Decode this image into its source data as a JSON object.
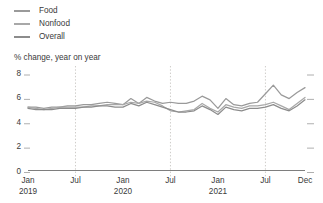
{
  "legend": {
    "position": "top-left",
    "items": [
      {
        "label": "Food",
        "color": "#9a9a9a",
        "icon": "line-swatch-icon"
      },
      {
        "label": "Nonfood",
        "color": "#a8a8a8",
        "icon": "line-swatch-icon"
      },
      {
        "label": "Overall",
        "color": "#8c8c8c",
        "icon": "line-swatch-icon"
      }
    ]
  },
  "axis": {
    "y_title": "% change, year on year",
    "y_ticks": [
      "8",
      "6",
      "4",
      "2",
      "0"
    ],
    "x_ticks": [
      {
        "label": "Jan",
        "sub": "2019"
      },
      {
        "label": "Jul",
        "sub": ""
      },
      {
        "label": "Jan",
        "sub": "2020"
      },
      {
        "label": "Jul",
        "sub": ""
      },
      {
        "label": "Jan",
        "sub": "2021"
      },
      {
        "label": "Jul",
        "sub": ""
      },
      {
        "label": "Dec",
        "sub": ""
      }
    ]
  },
  "chart_data": {
    "type": "line",
    "title": "",
    "subtitle": "",
    "xlabel": "",
    "ylabel": "% change, year on year",
    "ylim": [
      0,
      8
    ],
    "xlim": [
      "2019-01",
      "2021-12"
    ],
    "grid": "vertical-dashed-at-july",
    "legend_position": "top-left",
    "gridlines_x": [
      "2019-07",
      "2020-07",
      "2021-07"
    ],
    "x": [
      "2019-01",
      "2019-02",
      "2019-03",
      "2019-04",
      "2019-05",
      "2019-06",
      "2019-07",
      "2019-08",
      "2019-09",
      "2019-10",
      "2019-11",
      "2019-12",
      "2020-01",
      "2020-02",
      "2020-03",
      "2020-04",
      "2020-05",
      "2020-06",
      "2020-07",
      "2020-08",
      "2020-09",
      "2020-10",
      "2020-11",
      "2020-12",
      "2021-01",
      "2021-02",
      "2021-03",
      "2021-04",
      "2021-05",
      "2021-06",
      "2021-07",
      "2021-08",
      "2021-09",
      "2021-10",
      "2021-11",
      "2021-12"
    ],
    "series": [
      {
        "name": "Food",
        "color": "#9a9a9a",
        "values": [
          5.2,
          5.2,
          5.1,
          5.2,
          5.2,
          5.3,
          5.3,
          5.4,
          5.4,
          5.5,
          5.6,
          5.5,
          5.4,
          5.9,
          5.5,
          6.0,
          5.7,
          5.5,
          5.6,
          5.5,
          5.5,
          5.7,
          6.1,
          5.8,
          5.1,
          5.9,
          5.4,
          5.3,
          5.5,
          5.6,
          6.3,
          7.0,
          6.2,
          5.9,
          6.4,
          6.8
        ]
      },
      {
        "name": "Nonfood",
        "color": "#a8a8a8",
        "values": [
          5.2,
          5.1,
          5.0,
          5.1,
          5.2,
          5.2,
          5.2,
          5.2,
          5.3,
          5.3,
          5.4,
          5.4,
          5.4,
          5.6,
          5.5,
          5.7,
          5.6,
          5.3,
          4.9,
          4.8,
          4.9,
          5.0,
          5.5,
          5.1,
          4.8,
          5.4,
          5.2,
          5.1,
          5.3,
          5.3,
          5.4,
          5.6,
          5.3,
          5.0,
          5.5,
          6.0
        ]
      },
      {
        "name": "Overall",
        "color": "#8c8c8c",
        "values": [
          5.1,
          5.0,
          5.0,
          5.0,
          5.1,
          5.1,
          5.1,
          5.2,
          5.2,
          5.3,
          5.3,
          5.2,
          5.2,
          5.5,
          5.3,
          5.6,
          5.4,
          5.2,
          5.0,
          4.8,
          4.8,
          4.9,
          5.3,
          5.0,
          4.6,
          5.2,
          5.0,
          4.9,
          5.1,
          5.1,
          5.2,
          5.4,
          5.1,
          4.9,
          5.3,
          5.8
        ]
      }
    ]
  }
}
